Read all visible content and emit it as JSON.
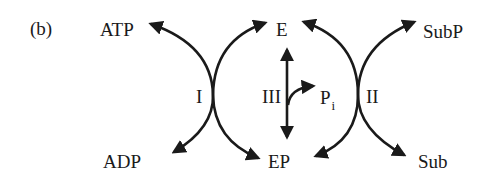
{
  "panel_label": "(b)",
  "species": {
    "atp": "ATP",
    "adp": "ADP",
    "e": "E",
    "ep": "EP",
    "pi_main": "P",
    "pi_sub": "i",
    "subp": "SubP",
    "sub": "Sub"
  },
  "reactions": {
    "r1": "I",
    "r2": "II",
    "r3": "III"
  },
  "colors": {
    "ink": "#1a1a1a",
    "background": "#ffffff"
  }
}
